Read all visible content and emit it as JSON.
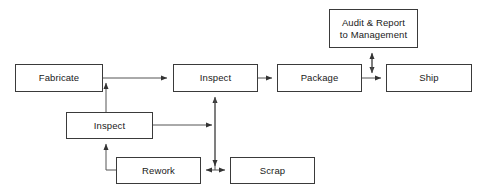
{
  "diagram": {
    "type": "flowchart",
    "colors": {
      "background": "#ffffff",
      "box_border": "#3a3a3a",
      "box_fill": "#ffffff",
      "line": "#555555",
      "text": "#1a1a1a"
    },
    "nodes": [
      {
        "id": "fabricate",
        "label": "Fabricate",
        "x": 15,
        "y": 64,
        "width": 88,
        "height": 28
      },
      {
        "id": "inspect-top",
        "label": "Inspect",
        "x": 173,
        "y": 64,
        "width": 85,
        "height": 28
      },
      {
        "id": "package",
        "label": "Package",
        "x": 277,
        "y": 64,
        "width": 85,
        "height": 28
      },
      {
        "id": "ship",
        "label": "Ship",
        "x": 386,
        "y": 64,
        "width": 86,
        "height": 28
      },
      {
        "id": "audit-report",
        "label": "Audit & Report\nto Management",
        "x": 329,
        "y": 9,
        "width": 89,
        "height": 39
      },
      {
        "id": "inspect-middle",
        "label": "Inspect",
        "x": 66,
        "y": 112,
        "width": 87,
        "height": 27
      },
      {
        "id": "rework",
        "label": "Rework",
        "x": 116,
        "y": 157,
        "width": 85,
        "height": 27
      },
      {
        "id": "scrap",
        "label": "Scrap",
        "x": 230,
        "y": 157,
        "width": 85,
        "height": 27
      }
    ],
    "edges": [
      {
        "id": "fabricate-to-inspect-top",
        "from": "fabricate",
        "to": "inspect-top",
        "arrows": "forward"
      },
      {
        "id": "inspect-top-to-package",
        "from": "inspect-top",
        "to": "package",
        "arrows": "forward"
      },
      {
        "id": "package-to-ship",
        "from": "package",
        "to": "ship",
        "arrows": "forward"
      },
      {
        "id": "audit-to-package-ship-line",
        "from": "audit-report",
        "to": "package-ship-link",
        "arrows": "both"
      },
      {
        "id": "inspect-middle-to-fabricate-output",
        "from": "inspect-middle",
        "to": "fabricate-output-line",
        "arrows": "forward"
      },
      {
        "id": "rework-to-inspect-middle",
        "from": "rework",
        "to": "inspect-middle",
        "arrows": "forward"
      },
      {
        "id": "inspect-middle-to-junction",
        "from": "inspect-middle",
        "to": "vertical-junction",
        "arrows": "forward"
      },
      {
        "id": "junction-to-inspect-top",
        "from": "vertical-junction",
        "to": "inspect-top",
        "arrows": "forward"
      },
      {
        "id": "junction-to-rework",
        "from": "vertical-junction",
        "to": "rework",
        "arrows": "forward"
      },
      {
        "id": "junction-to-scrap",
        "from": "vertical-junction",
        "to": "scrap",
        "arrows": "forward"
      }
    ]
  }
}
